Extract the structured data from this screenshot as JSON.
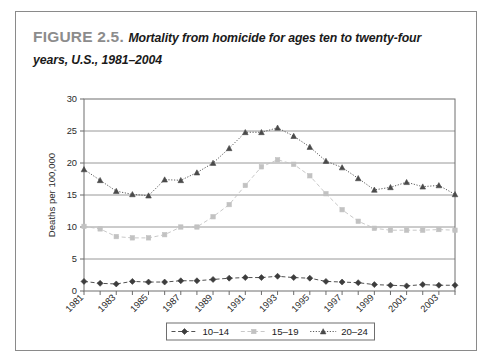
{
  "figure": {
    "label": "FIGURE 2.5.",
    "caption": "Mortality from homicide for ages ten to twenty-four years, U.S., 1981–2004"
  },
  "chart_data": {
    "type": "line",
    "title": "Mortality from homicide for ages ten to twenty-four years, U.S., 1981–2004",
    "xlabel": "",
    "ylabel": "Deaths per 100,000",
    "ylim": [
      0,
      30
    ],
    "yticks": [
      0,
      5,
      10,
      15,
      20,
      25,
      30
    ],
    "grid": true,
    "legend_position": "bottom",
    "x": [
      1981,
      1982,
      1983,
      1984,
      1985,
      1986,
      1987,
      1988,
      1989,
      1990,
      1991,
      1992,
      1993,
      1994,
      1995,
      1996,
      1997,
      1998,
      1999,
      2000,
      2001,
      2002,
      2003,
      2004
    ],
    "xtick_labels": [
      "1981",
      "1983",
      "1985",
      "1987",
      "1989",
      "1991",
      "1993",
      "1995",
      "1997",
      "1999",
      "2001",
      "2003"
    ],
    "series": [
      {
        "name": "10–14",
        "color": "#3d3d3d",
        "marker": "diamond",
        "dash": "dashed",
        "values": [
          1.5,
          1.2,
          1.1,
          1.5,
          1.4,
          1.4,
          1.6,
          1.6,
          1.8,
          2.0,
          2.1,
          2.1,
          2.3,
          2.1,
          2.0,
          1.5,
          1.4,
          1.3,
          1.0,
          0.9,
          0.8,
          1.0,
          0.9,
          0.9
        ],
        "ylim_note": "lowest band of chart"
      },
      {
        "name": "15–19",
        "color": "#c2c2c2",
        "marker": "square",
        "dash": "dashed",
        "values": [
          10.1,
          9.7,
          8.5,
          8.3,
          8.3,
          8.8,
          10.0,
          10.0,
          11.6,
          13.5,
          16.5,
          19.4,
          20.5,
          19.8,
          18.0,
          15.2,
          12.7,
          10.9,
          9.8,
          9.5,
          9.5,
          9.5,
          9.6,
          9.5
        ]
      },
      {
        "name": "20–24",
        "color": "#4a4a4a",
        "marker": "triangle",
        "dash": "dotted",
        "values": [
          19.0,
          17.3,
          15.6,
          15.1,
          14.9,
          17.4,
          17.3,
          18.5,
          20.0,
          22.3,
          24.8,
          24.8,
          25.5,
          24.2,
          22.5,
          20.3,
          19.3,
          17.6,
          15.8,
          16.2,
          17.0,
          16.3,
          16.5,
          15.1
        ]
      }
    ]
  },
  "legend": {
    "items": [
      {
        "label": "10–14"
      },
      {
        "label": "15–19"
      },
      {
        "label": "20–24"
      }
    ]
  }
}
